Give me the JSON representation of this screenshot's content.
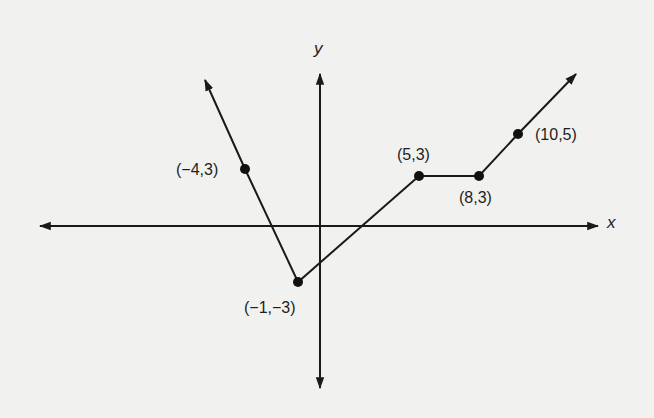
{
  "axes": {
    "x_label": "x",
    "y_label": "y"
  },
  "points": [
    {
      "label": "(−4,3)",
      "x": -4,
      "y": 3
    },
    {
      "label": "(−1,−3)",
      "x": -1,
      "y": -3
    },
    {
      "label": "(5,3)",
      "x": 5,
      "y": 3
    },
    {
      "label": "(8,3)",
      "x": 8,
      "y": 3
    },
    {
      "label": "(10,5)",
      "x": 10,
      "y": 5
    }
  ],
  "colors": {
    "background": "#f1f1ef",
    "ink": "#1a1a1a"
  }
}
